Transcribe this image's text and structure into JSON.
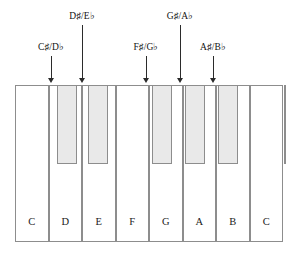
{
  "diagram": {
    "keyboard": {
      "white_key_count": 8,
      "black_key_count": 6,
      "left": 16,
      "top": 85,
      "width": 268,
      "height": 157,
      "white_key_width": 33.5,
      "black_key_width": 20,
      "black_key_height": 79
    },
    "colors": {
      "white_key_fill": "#ffffff",
      "black_key_fill": "#e9e9e9",
      "key_outline": "#8d8d8d",
      "text": "#111111",
      "arrow": "#2b2b2b"
    },
    "white_keys": [
      {
        "label": "C",
        "index": 0
      },
      {
        "label": "D",
        "index": 1
      },
      {
        "label": "E",
        "index": 2
      },
      {
        "label": "F",
        "index": 3
      },
      {
        "label": "G",
        "index": 4
      },
      {
        "label": "A",
        "index": 5
      },
      {
        "label": "B",
        "index": 6
      },
      {
        "label": "C",
        "index": 7
      }
    ],
    "black_keys": [
      {
        "name": "C-sharp-D-flat",
        "x": 41,
        "clipped": false
      },
      {
        "name": "D-sharp-E-flat",
        "x": 72,
        "clipped": false
      },
      {
        "name": "F-sharp-G-flat",
        "x": 136,
        "clipped": false
      },
      {
        "name": "G-sharp-A-flat",
        "x": 169,
        "clipped": false
      },
      {
        "name": "A-sharp-B-flat",
        "x": 202,
        "clipped": false
      },
      {
        "name": "C-sharp-D-flat-upper",
        "x": 268,
        "clipped": true
      }
    ],
    "annotations": [
      {
        "id": "c-sharp-d-flat",
        "natural": "C",
        "accidental_sharp": "♯",
        "slash": "/",
        "natural_flat": "D",
        "accidental_flat": "♭",
        "text": "C♯/D♭",
        "label_x": 51,
        "label_y": 41,
        "arrow_x": 51,
        "arrow_top": 56,
        "arrow_bottom": 83
      },
      {
        "id": "d-sharp-e-flat",
        "natural": "D",
        "accidental_sharp": "♯",
        "slash": "/",
        "natural_flat": "E",
        "accidental_flat": "♭",
        "text": "D♯/E♭",
        "label_x": 82,
        "label_y": 10,
        "arrow_x": 82,
        "arrow_top": 25,
        "arrow_bottom": 83
      },
      {
        "id": "f-sharp-g-flat",
        "natural": "F",
        "accidental_sharp": "♯",
        "slash": "/",
        "natural_flat": "G",
        "accidental_flat": "♭",
        "text": "F♯/G♭",
        "label_x": 146,
        "label_y": 41,
        "arrow_x": 146,
        "arrow_top": 56,
        "arrow_bottom": 83
      },
      {
        "id": "g-sharp-a-flat",
        "natural": "G",
        "accidental_sharp": "♯",
        "slash": "/",
        "natural_flat": "A",
        "accidental_flat": "♭",
        "text": "G♯/A♭",
        "label_x": 180,
        "label_y": 10,
        "arrow_x": 180,
        "arrow_top": 25,
        "arrow_bottom": 83
      },
      {
        "id": "a-sharp-b-flat",
        "natural": "A",
        "accidental_sharp": "♯",
        "slash": "/",
        "natural_flat": "B",
        "accidental_flat": "♭",
        "text": "A♯/B♭",
        "label_x": 213,
        "label_y": 41,
        "arrow_x": 213,
        "arrow_top": 56,
        "arrow_bottom": 83
      }
    ]
  }
}
